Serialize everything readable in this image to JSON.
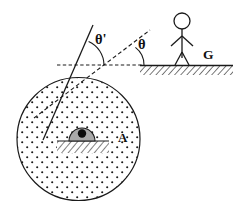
{
  "figure": {
    "background": "#ffffff",
    "ink": "#1a1a1a",
    "dome_fill": "#a9a9a9",
    "width": 238,
    "height": 209
  },
  "labels": {
    "theta_prime": "θ'",
    "theta": "θ",
    "body_a": "A",
    "ground_g": "G"
  },
  "circle": {
    "name": "A",
    "center_x": 78.5,
    "center_y": 139,
    "radius": 61.5,
    "fill_pattern": "dotted-stipple"
  },
  "dome": {
    "center_x": 82,
    "base_y": 141,
    "radius": 13,
    "dot_radius": 4.2,
    "fill": "#a9a9a9"
  },
  "hatch_base": {
    "x": 57,
    "y": 141,
    "width": 52,
    "height": 12
  },
  "reference_line": {
    "type": "dashed-horizontal",
    "x1": 57,
    "x2": 143,
    "y": 65
  },
  "rays": [
    {
      "name": "normal-ray-solid",
      "style": "solid",
      "x1": 43,
      "y1": 140,
      "x2": 93,
      "y2": 25
    },
    {
      "name": "incident-ray-dashed",
      "style": "dashed",
      "x1": 34,
      "y1": 118,
      "x2": 150,
      "y2": 30
    }
  ],
  "angles": [
    {
      "name": "theta-prime",
      "label": "θ'",
      "vertex_x": 78,
      "vertex_y": 65,
      "label_x": 95,
      "label_y": 44
    },
    {
      "name": "theta",
      "label": "θ",
      "vertex_x": 122,
      "vertex_y": 65,
      "label_x": 139,
      "label_y": 48
    }
  ],
  "ground": {
    "line_x1": 140,
    "line_x2": 233,
    "line_y": 66,
    "hatch_height": 9,
    "label": "G",
    "label_x": 208,
    "label_y": 58
  },
  "person": {
    "name": "stick-figure",
    "head_cx": 182,
    "head_cy": 21,
    "head_r": 8,
    "body_top_y": 29,
    "body_bottom_y": 58,
    "arm_y": 36,
    "arm_span": 11,
    "leg_spread": 7
  }
}
